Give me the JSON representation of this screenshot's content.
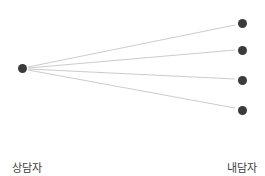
{
  "diagram": {
    "type": "node-link-fan",
    "canvas": {
      "width": 265,
      "height": 176,
      "background": "#ffffff"
    },
    "style": {
      "node_color": "#3b3b3b",
      "node_diameter": 9,
      "edge_color": "#cccccc",
      "edge_width": 1,
      "text_color": "#3d3d3d"
    },
    "nodes": {
      "source": {
        "id": "counselor",
        "cx": 22,
        "cy": 68
      },
      "targets": [
        {
          "id": "client-1",
          "cx": 242,
          "cy": 23
        },
        {
          "id": "client-2",
          "cx": 242,
          "cy": 50
        },
        {
          "id": "client-3",
          "cx": 242,
          "cy": 80
        },
        {
          "id": "client-4",
          "cx": 242,
          "cy": 110
        }
      ]
    },
    "edges": [
      {
        "from": "counselor",
        "to": "client-1",
        "x1": 28,
        "y1": 67,
        "x2": 235,
        "y2": 25
      },
      {
        "from": "counselor",
        "to": "client-2",
        "x1": 28,
        "y1": 68,
        "x2": 235,
        "y2": 50
      },
      {
        "from": "counselor",
        "to": "client-3",
        "x1": 28,
        "y1": 69,
        "x2": 235,
        "y2": 79
      },
      {
        "from": "counselor",
        "to": "client-4",
        "x1": 28,
        "y1": 70,
        "x2": 235,
        "y2": 108
      }
    ],
    "labels": {
      "source_label": "상담자",
      "target_label_line1": "내담자",
      "target_label_line2": "팀"
    }
  }
}
